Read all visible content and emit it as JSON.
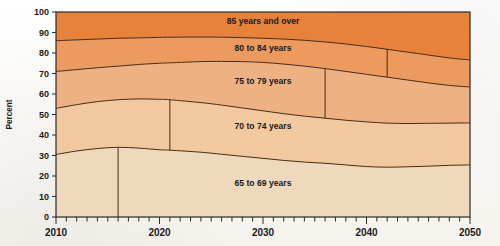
{
  "chart_data": {
    "type": "area",
    "title": "",
    "subtitle": "",
    "xlabel": "",
    "ylabel": "Percent",
    "ylim": [
      0,
      100
    ],
    "xlim": [
      2010,
      2050
    ],
    "y_ticks": [
      "0",
      "10",
      "20",
      "30",
      "40",
      "50",
      "60",
      "70",
      "80",
      "90",
      "100"
    ],
    "x_ticks": [
      "2010",
      "2020",
      "2030",
      "2040",
      "2050"
    ],
    "x_minor_tick_interval": 1,
    "grid": false,
    "legend_position": "inline-band-labels",
    "stacked": true,
    "stack_order_bottom_to_top": [
      "65 to 69 years",
      "70 to 74 years",
      "75 to 79 years",
      "80 to 84 years",
      "85 years and over"
    ],
    "x": [
      2010,
      2012,
      2014,
      2016,
      2018,
      2020,
      2021,
      2024,
      2026,
      2028,
      2030,
      2032,
      2034,
      2036,
      2038,
      2040,
      2042,
      2044,
      2046,
      2048,
      2050
    ],
    "series": [
      {
        "name": "65 to 69 years",
        "color": "#efd9bc",
        "cumulative_top": [
          30.5,
          32.2,
          33.4,
          34.0,
          33.6,
          32.8,
          32.6,
          31.6,
          30.6,
          29.6,
          28.6,
          27.6,
          26.8,
          26.2,
          25.4,
          24.6,
          24.3,
          24.5,
          24.8,
          25.2,
          25.4
        ]
      },
      {
        "name": "70 to 74 years",
        "color": "#f2c89e",
        "cumulative_top": [
          53.0,
          54.8,
          56.3,
          57.2,
          57.6,
          57.4,
          57.2,
          55.8,
          54.6,
          53.2,
          51.8,
          50.4,
          49.2,
          48.2,
          47.2,
          46.4,
          45.8,
          45.6,
          45.7,
          45.8,
          45.9
        ]
      },
      {
        "name": "75 to 79 years",
        "color": "#eeb184",
        "cumulative_top": [
          71.0,
          71.9,
          72.8,
          73.6,
          74.4,
          75.0,
          75.2,
          75.8,
          75.9,
          75.8,
          75.4,
          74.6,
          73.6,
          72.4,
          71.0,
          69.6,
          68.2,
          66.8,
          65.4,
          64.2,
          63.4
        ]
      },
      {
        "name": "80 to 84 years",
        "color": "#ec9a5e",
        "cumulative_top": [
          86.0,
          86.4,
          86.8,
          87.2,
          87.4,
          87.6,
          87.7,
          87.8,
          87.7,
          87.5,
          87.2,
          86.8,
          86.2,
          85.4,
          84.4,
          83.2,
          81.8,
          80.4,
          79.0,
          77.6,
          76.6
        ]
      },
      {
        "name": "85 years and over",
        "color": "#e8823b",
        "cumulative_top": [
          100,
          100,
          100,
          100,
          100,
          100,
          100,
          100,
          100,
          100,
          100,
          100,
          100,
          100,
          100,
          100,
          100,
          100,
          100,
          100,
          100
        ]
      }
    ],
    "vertical_divider_years": [
      2016,
      2021,
      2036,
      2042
    ],
    "band_label_positions": [
      {
        "label": "85 years and over",
        "x": 2030,
        "y": 94
      },
      {
        "label": "80 to 84 years",
        "x": 2030,
        "y": 81
      },
      {
        "label": "75 to 79 years",
        "x": 2030,
        "y": 65
      },
      {
        "label": "70 to 74 years",
        "x": 2030,
        "y": 43
      },
      {
        "label": "65 to 69 years",
        "x": 2030,
        "y": 15
      }
    ]
  },
  "colors": {
    "band_65_69": "#efd9bc",
    "band_70_74": "#f2c89e",
    "band_75_79": "#eeb184",
    "band_80_84": "#ec9a5e",
    "band_85_over": "#e8823b",
    "line": "#4a2a16",
    "frame": "#2b2b2b",
    "text": "#1a1a1a",
    "background": "#fdfcfa"
  }
}
